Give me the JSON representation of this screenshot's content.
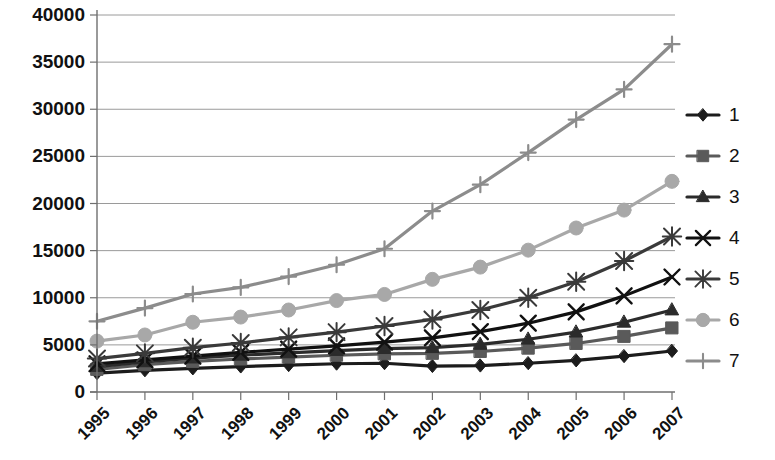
{
  "chart_data": {
    "type": "line",
    "title": "",
    "subtitle": "",
    "xlabel": "",
    "ylabel": "",
    "xlim": [
      1995,
      2007
    ],
    "ylim": [
      0,
      40000
    ],
    "ytick_step": 5000,
    "grid": true,
    "legend_position": "right",
    "x": [
      1995,
      1996,
      1997,
      1998,
      1999,
      2000,
      2001,
      2002,
      2003,
      2004,
      2005,
      2006,
      2007
    ],
    "categories": [
      "1995",
      "1996",
      "1997",
      "1998",
      "1999",
      "2000",
      "2001",
      "2002",
      "2003",
      "2004",
      "2005",
      "2006",
      "2007"
    ],
    "ytick_labels": [
      "0",
      "5000",
      "10000",
      "15000",
      "20000",
      "25000",
      "30000",
      "35000",
      "40000"
    ],
    "ytick_values": [
      0,
      5000,
      10000,
      15000,
      20000,
      25000,
      30000,
      35000,
      40000
    ],
    "series": [
      {
        "name": "1",
        "marker": "diamond",
        "color": "#1c1c1c",
        "values": [
          2000,
          2300,
          2500,
          2700,
          2850,
          3000,
          3050,
          2750,
          2800,
          3050,
          3350,
          3800,
          4350
        ]
      },
      {
        "name": "2",
        "marker": "square",
        "color": "#5a5a5a",
        "values": [
          2400,
          2900,
          3250,
          3500,
          3700,
          3900,
          4050,
          4100,
          4300,
          4650,
          5150,
          5900,
          6800
        ]
      },
      {
        "name": "3",
        "marker": "triangle",
        "color": "#2b2b2b",
        "values": [
          2700,
          3200,
          3600,
          3900,
          4150,
          4400,
          4600,
          4700,
          5050,
          5600,
          6350,
          7400,
          8700
        ]
      },
      {
        "name": "4",
        "marker": "x",
        "color": "#111111",
        "values": [
          3000,
          3400,
          3800,
          4200,
          4550,
          4900,
          5300,
          5750,
          6400,
          7300,
          8500,
          10200,
          12200
        ]
      },
      {
        "name": "5",
        "marker": "star",
        "color": "#3a3a3a",
        "values": [
          3550,
          4100,
          4700,
          5200,
          5800,
          6350,
          7000,
          7700,
          8700,
          10000,
          11700,
          13900,
          16500
        ]
      },
      {
        "name": "6",
        "marker": "circle",
        "color": "#a8a8a8",
        "values": [
          5400,
          6050,
          7400,
          7950,
          8700,
          9700,
          10350,
          11950,
          13250,
          15050,
          17400,
          19300,
          22350
        ]
      },
      {
        "name": "7",
        "marker": "plus",
        "color": "#8c8c8c",
        "values": [
          7500,
          8900,
          10400,
          11100,
          12250,
          13500,
          15200,
          19200,
          22000,
          25400,
          28900,
          32100,
          36900
        ]
      }
    ],
    "legend_entries": [
      {
        "label": "1",
        "marker": "diamond",
        "color": "#1c1c1c"
      },
      {
        "label": "2",
        "marker": "square",
        "color": "#5a5a5a"
      },
      {
        "label": "3",
        "marker": "triangle",
        "color": "#2b2b2b"
      },
      {
        "label": "4",
        "marker": "x",
        "color": "#111111"
      },
      {
        "label": "5",
        "marker": "star",
        "color": "#3a3a3a"
      },
      {
        "label": "6",
        "marker": "circle",
        "color": "#a8a8a8"
      },
      {
        "label": "7",
        "marker": "plus",
        "color": "#8c8c8c"
      }
    ],
    "colors": {
      "grid": "#9a9a9a",
      "axis": "#6f6f6f",
      "text": "#111111",
      "background": "#ffffff"
    }
  }
}
